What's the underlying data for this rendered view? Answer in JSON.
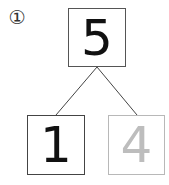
{
  "problem": {
    "label": "①",
    "whole": "5",
    "parts": [
      {
        "value": "1",
        "style": "solid"
      },
      {
        "value": "4",
        "style": "traced"
      }
    ]
  },
  "colors": {
    "ink": "#111111",
    "trace_gray": "#bdbdbd",
    "border": "#555555",
    "border_faint": "#b8b8b8"
  }
}
